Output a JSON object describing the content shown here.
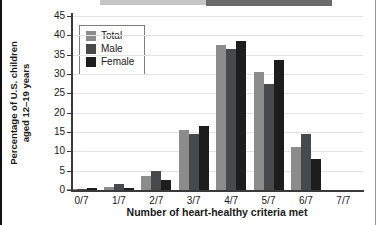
{
  "chart_data": {
    "type": "bar",
    "categories": [
      "0/7",
      "1/7",
      "2/7",
      "3/7",
      "4/7",
      "5/7",
      "6/7",
      "7/7"
    ],
    "series": [
      {
        "name": "Total",
        "color": "#8c8c8c",
        "values": [
          0.2,
          0.8,
          3.5,
          15.5,
          37.5,
          30.5,
          11.0,
          0
        ]
      },
      {
        "name": "Male",
        "color": "#47494a",
        "values": [
          0.2,
          1.6,
          5.0,
          14.5,
          36.5,
          27.5,
          14.5,
          0
        ]
      },
      {
        "name": "Female",
        "color": "#1d1d1d",
        "values": [
          0.5,
          0.5,
          2.5,
          16.5,
          38.5,
          33.5,
          8.0,
          0
        ]
      }
    ],
    "title": "",
    "xlabel": "Number of heart-healthy criteria met",
    "ylabel": "Percentage of U.S. children aged 12–19 years",
    "ylabel_lines": [
      "Percentage of U.S. children",
      "aged 12–19 years"
    ],
    "ylim": [
      0,
      45
    ],
    "yticks": [
      0,
      5,
      10,
      15,
      20,
      25,
      30,
      35,
      40,
      45
    ],
    "grid": "horizontal",
    "legend_position": "upper-left"
  }
}
